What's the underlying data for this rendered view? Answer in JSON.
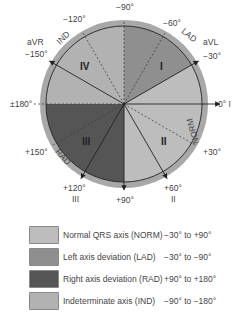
{
  "diagram": {
    "angle_labels": [
      {
        "angle": -90,
        "text": "−90°"
      },
      {
        "angle": -60,
        "text": "−60°"
      },
      {
        "angle": -30,
        "text": "−30°"
      },
      {
        "angle": 0,
        "text": "0° I"
      },
      {
        "angle": 30,
        "text": "+30°"
      },
      {
        "angle": 60,
        "text": "+60°"
      },
      {
        "angle": 90,
        "text": "+90°"
      },
      {
        "angle": 120,
        "text": "+120°"
      },
      {
        "angle": 150,
        "text": "+150°"
      },
      {
        "angle": 180,
        "text": "±180°"
      },
      {
        "angle": -150,
        "text": "−150°"
      },
      {
        "angle": -120,
        "text": "−120°"
      }
    ],
    "lead_labels": {
      "aVL": "aVL",
      "aVR": "aVR",
      "aVF": "aVF",
      "II": "II",
      "III": "III"
    },
    "zone_labels": {
      "LAD": "LAD",
      "NORM": "NORM",
      "RAD": "RAD",
      "IND": "IND"
    },
    "quadrant_labels": {
      "I": "I",
      "II": "II",
      "III": "III",
      "IV": "IV"
    },
    "lead_axes": [
      {
        "name": "I",
        "angle": 0
      },
      {
        "name": "aVL",
        "angle": -30
      },
      {
        "name": "II",
        "angle": 60
      },
      {
        "name": "aVF",
        "angle": 90
      },
      {
        "name": "III",
        "angle": 120
      },
      {
        "name": "aVR",
        "angle": -150
      }
    ],
    "dashed_axes": [
      -60,
      -120,
      30,
      150,
      -90
    ],
    "sectors": [
      {
        "zone": "NORM",
        "from": -30,
        "to": 90,
        "color": "#bdbdbd"
      },
      {
        "zone": "LAD",
        "from": -90,
        "to": -30,
        "color": "#8f8f8f"
      },
      {
        "zone": "RAD",
        "from": 90,
        "to": 180,
        "color": "#555555"
      },
      {
        "zone": "IND",
        "from": -180,
        "to": -90,
        "color": "#b2b2b2"
      }
    ],
    "rim_color": "#a8a8a8"
  },
  "legend": [
    {
      "label": "Normal QRS axis (NORM)",
      "range": "−30° to +90°",
      "color": "#bdbdbd"
    },
    {
      "label": "Left axis deviation (LAD)",
      "range": "−30° to −90°",
      "color": "#8f8f8f"
    },
    {
      "label": "Right axis deviation (RAD)",
      "range": "+90° to +180°",
      "color": "#555555"
    },
    {
      "label": "Indeterminate axis (IND)",
      "range": "−90° to −180°",
      "color": "#b2b2b2"
    }
  ]
}
